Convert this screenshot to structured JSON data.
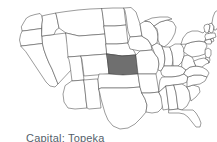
{
  "figure": {
    "kind": "us-states-outline-map",
    "background_color": "#ffffff",
    "outline_color": "#4a4a4a",
    "default_state_fill": "#ffffff",
    "highlight_fill": "#6f6f6f",
    "highlight_state": "Kansas",
    "highlight_state_abbr": "KS"
  },
  "caption": {
    "text": "Capital: Topeka",
    "label": "Capital",
    "value": "Topeka",
    "color": "#555f6b",
    "clipped": "true"
  },
  "states": [
    {
      "abbr": "WA",
      "name": "Washington",
      "highlighted": "false"
    },
    {
      "abbr": "OR",
      "name": "Oregon",
      "highlighted": "false"
    },
    {
      "abbr": "CA",
      "name": "California",
      "highlighted": "false"
    },
    {
      "abbr": "NV",
      "name": "Nevada",
      "highlighted": "false"
    },
    {
      "abbr": "ID",
      "name": "Idaho",
      "highlighted": "false"
    },
    {
      "abbr": "MT",
      "name": "Montana",
      "highlighted": "false"
    },
    {
      "abbr": "WY",
      "name": "Wyoming",
      "highlighted": "false"
    },
    {
      "abbr": "UT",
      "name": "Utah",
      "highlighted": "false"
    },
    {
      "abbr": "AZ",
      "name": "Arizona",
      "highlighted": "false"
    },
    {
      "abbr": "CO",
      "name": "Colorado",
      "highlighted": "false"
    },
    {
      "abbr": "NM",
      "name": "New Mexico",
      "highlighted": "false"
    },
    {
      "abbr": "ND",
      "name": "North Dakota",
      "highlighted": "false"
    },
    {
      "abbr": "SD",
      "name": "South Dakota",
      "highlighted": "false"
    },
    {
      "abbr": "NE",
      "name": "Nebraska",
      "highlighted": "false"
    },
    {
      "abbr": "KS",
      "name": "Kansas",
      "highlighted": "true"
    },
    {
      "abbr": "OK",
      "name": "Oklahoma",
      "highlighted": "false"
    },
    {
      "abbr": "TX",
      "name": "Texas",
      "highlighted": "false"
    },
    {
      "abbr": "MN",
      "name": "Minnesota",
      "highlighted": "false"
    },
    {
      "abbr": "IA",
      "name": "Iowa",
      "highlighted": "false"
    },
    {
      "abbr": "MO",
      "name": "Missouri",
      "highlighted": "false"
    },
    {
      "abbr": "AR",
      "name": "Arkansas",
      "highlighted": "false"
    },
    {
      "abbr": "LA",
      "name": "Louisiana",
      "highlighted": "false"
    },
    {
      "abbr": "WI",
      "name": "Wisconsin",
      "highlighted": "false"
    },
    {
      "abbr": "IL",
      "name": "Illinois",
      "highlighted": "false"
    },
    {
      "abbr": "MI",
      "name": "Michigan",
      "highlighted": "false"
    },
    {
      "abbr": "IN",
      "name": "Indiana",
      "highlighted": "false"
    },
    {
      "abbr": "OH",
      "name": "Ohio",
      "highlighted": "false"
    },
    {
      "abbr": "KY",
      "name": "Kentucky",
      "highlighted": "false"
    },
    {
      "abbr": "TN",
      "name": "Tennessee",
      "highlighted": "false"
    },
    {
      "abbr": "MS",
      "name": "Mississippi",
      "highlighted": "false"
    },
    {
      "abbr": "AL",
      "name": "Alabama",
      "highlighted": "false"
    },
    {
      "abbr": "GA",
      "name": "Georgia",
      "highlighted": "false"
    },
    {
      "abbr": "FL",
      "name": "Florida",
      "highlighted": "false"
    },
    {
      "abbr": "SC",
      "name": "South Carolina",
      "highlighted": "false"
    },
    {
      "abbr": "NC",
      "name": "North Carolina",
      "highlighted": "false"
    },
    {
      "abbr": "VA",
      "name": "Virginia",
      "highlighted": "false"
    },
    {
      "abbr": "WV",
      "name": "West Virginia",
      "highlighted": "false"
    },
    {
      "abbr": "MD",
      "name": "Maryland",
      "highlighted": "false"
    },
    {
      "abbr": "DE",
      "name": "Delaware",
      "highlighted": "false"
    },
    {
      "abbr": "NJ",
      "name": "New Jersey",
      "highlighted": "false"
    },
    {
      "abbr": "PA",
      "name": "Pennsylvania",
      "highlighted": "false"
    },
    {
      "abbr": "NY",
      "name": "New York",
      "highlighted": "false"
    },
    {
      "abbr": "CT",
      "name": "Connecticut",
      "highlighted": "false"
    },
    {
      "abbr": "RI",
      "name": "Rhode Island",
      "highlighted": "false"
    },
    {
      "abbr": "MA",
      "name": "Massachusetts",
      "highlighted": "false"
    },
    {
      "abbr": "VT",
      "name": "Vermont",
      "highlighted": "false"
    },
    {
      "abbr": "NH",
      "name": "New Hampshire",
      "highlighted": "false"
    },
    {
      "abbr": "ME",
      "name": "Maine",
      "highlighted": "false"
    }
  ]
}
